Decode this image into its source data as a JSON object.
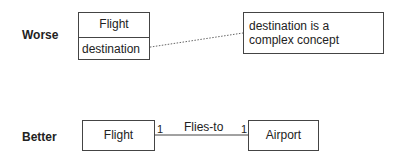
{
  "rows": {
    "worse": {
      "label": "Worse",
      "class_box": {
        "name": "Flight",
        "attribute": "destination"
      },
      "note": {
        "text": "destination is a complex concept"
      }
    },
    "better": {
      "label": "Better",
      "left_class": "Flight",
      "right_class": "Airport",
      "association": {
        "name": "Flies-to",
        "left_multiplicity": "1",
        "right_multiplicity": "1"
      }
    }
  }
}
